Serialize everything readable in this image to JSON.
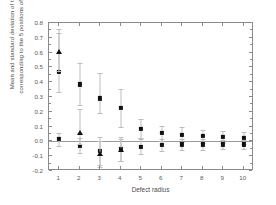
{
  "chart_data": {
    "type": "scatter",
    "title": "",
    "xlabel": "Defect radius",
    "ylabel": "Mean and standard deviation of the 5 (s.d.) corresponding to the 5 positions of the defects",
    "xlim": [
      0.5,
      10.5
    ],
    "ylim": [
      -0.2,
      0.8
    ],
    "grid": false,
    "legend": "none",
    "x": [
      1,
      2,
      3,
      4,
      5,
      6,
      7,
      8,
      9,
      10
    ],
    "xticklabels": [
      "1",
      "2",
      "3",
      "4",
      "5",
      "6",
      "7",
      "8",
      "9",
      "10"
    ],
    "yticklabels": [
      "0.8",
      "0.7",
      "0.6",
      "0.5",
      "0.4",
      "0.3",
      "0.2",
      "0.1",
      "0.0",
      "-0.1",
      "-0.2"
    ],
    "ytickvalues": [
      0.8,
      0.7,
      0.6,
      0.5,
      0.4,
      0.3,
      0.2,
      0.1,
      0.0,
      -0.1,
      -0.2
    ],
    "zero_reference_line": 0.0,
    "series": [
      {
        "name": "upper-series-square",
        "marker": "square",
        "color": "#111111",
        "values": [
          0.47,
          0.385,
          0.29,
          0.225,
          0.085,
          0.055,
          0.045,
          0.035,
          0.03,
          0.025
        ],
        "err_lower": [
          0.135,
          0.14,
          0.1,
          0.13,
          0.065,
          0.05,
          0.05,
          0.045,
          0.04,
          0.04
        ],
        "err_upper": [
          0.265,
          0.145,
          0.175,
          0.13,
          0.065,
          0.05,
          0.05,
          0.045,
          0.04,
          0.04
        ]
      },
      {
        "name": "upper-series-triangle",
        "marker": "triangle",
        "color": "#111111",
        "values": [
          0.605,
          null,
          null,
          null,
          null,
          null,
          null,
          null,
          null,
          null
        ],
        "err_lower": [
          0.13,
          null,
          null,
          null,
          null,
          null,
          null,
          null,
          null,
          null
        ],
        "err_upper": [
          0.155,
          null,
          null,
          null,
          null,
          null,
          null,
          null,
          null,
          null
        ]
      },
      {
        "name": "lower-series-square",
        "marker": "square",
        "color": "#111111",
        "values": [
          0.015,
          -0.03,
          -0.065,
          -0.05,
          -0.035,
          -0.025,
          -0.02,
          -0.02,
          -0.02,
          -0.02
        ],
        "err_lower": [
          0.045,
          0.05,
          0.095,
          0.08,
          0.05,
          0.04,
          0.035,
          0.035,
          0.03,
          0.03
        ],
        "err_upper": [
          0.045,
          0.05,
          0.095,
          0.08,
          0.05,
          0.04,
          0.035,
          0.035,
          0.03,
          0.03
        ]
      },
      {
        "name": "lower-series-triangle",
        "marker": "triangle",
        "color": "#111111",
        "values": [
          null,
          0.055,
          -0.085,
          -0.06,
          null,
          null,
          null,
          null,
          null,
          null
        ],
        "err_lower": [
          null,
          0.075,
          0.09,
          0.075,
          null,
          null,
          null,
          null,
          null,
          null
        ],
        "err_upper": [
          null,
          0.165,
          0.09,
          0.075,
          null,
          null,
          null,
          null,
          null,
          null
        ]
      }
    ]
  }
}
